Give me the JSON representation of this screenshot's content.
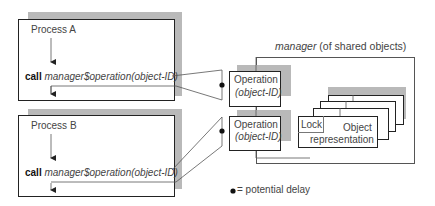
{
  "process_a": {
    "title": "Process A",
    "call_keyword": "call",
    "call_expr": "manager$operation(object-ID)"
  },
  "process_b": {
    "title": "Process B",
    "call_keyword": "call",
    "call_expr": "manager$operation(object-ID)"
  },
  "operations": [
    {
      "line1": "Operation",
      "line2": "(object-ID)"
    },
    {
      "line1": "Operation",
      "line2": "(object-ID)"
    }
  ],
  "manager": {
    "label_italic": "manager",
    "label_rest": " (of shared objects)"
  },
  "object_stack": {
    "lock_label": "Lock",
    "object_line1": "Object",
    "object_line2": "representation"
  },
  "legend": {
    "bullet": "●",
    "text": " = potential delay"
  },
  "colors": {
    "shadow": "#b9b9b9",
    "border": "#222222",
    "text": "#444444"
  }
}
